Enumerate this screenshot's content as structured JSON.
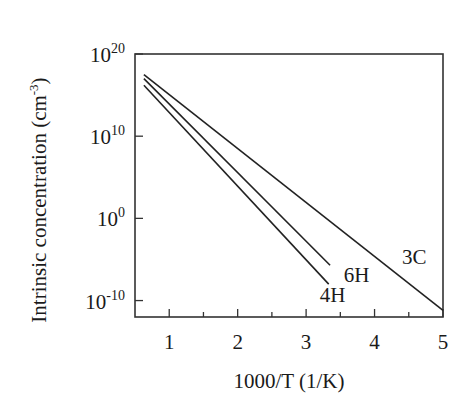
{
  "chart_data": {
    "type": "line",
    "title": "",
    "xlabel": "1000/T (1/K)",
    "ylabel": "Intrinsic concentration (cm",
    "ylabel_sup": "-3",
    "ylabel_close": ")",
    "xlim": [
      0.5,
      5
    ],
    "ylim_log10": [
      -12,
      20
    ],
    "yscale": "log",
    "x_ticks": [
      1,
      2,
      3,
      4,
      5
    ],
    "x_tick_labels": [
      "1",
      "2",
      "3",
      "4",
      "5"
    ],
    "y_ticks_log10": [
      20,
      10,
      0,
      -10
    ],
    "y_tick_labels": [
      {
        "base": "10",
        "exp": "20"
      },
      {
        "base": "10",
        "exp": "10"
      },
      {
        "base": "10",
        "exp": "0"
      },
      {
        "base": "10",
        "exp": "-10"
      }
    ],
    "grid": false,
    "legend": "inline labels",
    "series": [
      {
        "name": "3C",
        "x": [
          0.63,
          5.0
        ],
        "log10_y": [
          17.5,
          -11.2
        ]
      },
      {
        "name": "6H",
        "x": [
          0.63,
          3.35
        ],
        "log10_y": [
          17.0,
          -5.7
        ]
      },
      {
        "name": "4H",
        "x": [
          0.63,
          3.33
        ],
        "log10_y": [
          16.2,
          -8.0
        ]
      }
    ],
    "annotations": [
      {
        "text": "3C",
        "x": 4.4,
        "log10_y": -5.5
      },
      {
        "text": "6H",
        "x": 3.55,
        "log10_y": -7.8
      },
      {
        "text": "4H",
        "x": 3.2,
        "log10_y": -10.2
      }
    ]
  }
}
